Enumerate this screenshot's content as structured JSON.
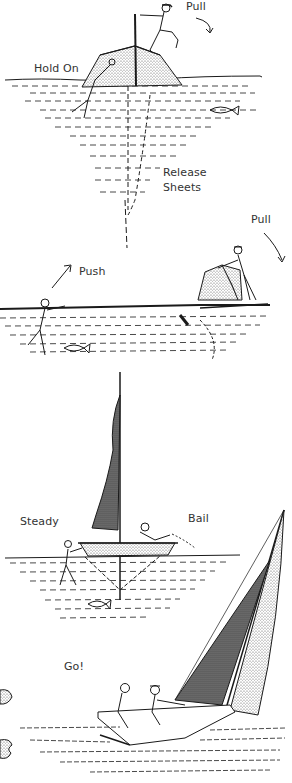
{
  "figure": {
    "colors": {
      "ink": "#1a1a1a",
      "text": "#333333",
      "background": "#ffffff",
      "stipple": "#555555"
    },
    "steps": [
      {
        "id": "step-1",
        "labels": [
          {
            "name": "label-pull-1",
            "text": "Pull",
            "x": 186,
            "y": 0
          },
          {
            "name": "label-hold-on",
            "text": "Hold On",
            "x": 34,
            "y": 62
          },
          {
            "name": "label-release-sheets-line1",
            "text": "Release",
            "x": 163,
            "y": 166
          },
          {
            "name": "label-release-sheets-line2",
            "text": "Sheets",
            "x": 163,
            "y": 181
          }
        ]
      },
      {
        "id": "step-2",
        "labels": [
          {
            "name": "label-push",
            "text": "Push",
            "x": 79,
            "y": 265
          },
          {
            "name": "label-pull-2",
            "text": "Pull",
            "x": 251,
            "y": 213
          }
        ]
      },
      {
        "id": "step-3",
        "labels": [
          {
            "name": "label-steady",
            "text": "Steady",
            "x": 20,
            "y": 515
          },
          {
            "name": "label-bail",
            "text": "Bail",
            "x": 188,
            "y": 512
          }
        ]
      },
      {
        "id": "step-4",
        "labels": [
          {
            "name": "label-go",
            "text": "Go!",
            "x": 64,
            "y": 660
          }
        ]
      }
    ]
  }
}
